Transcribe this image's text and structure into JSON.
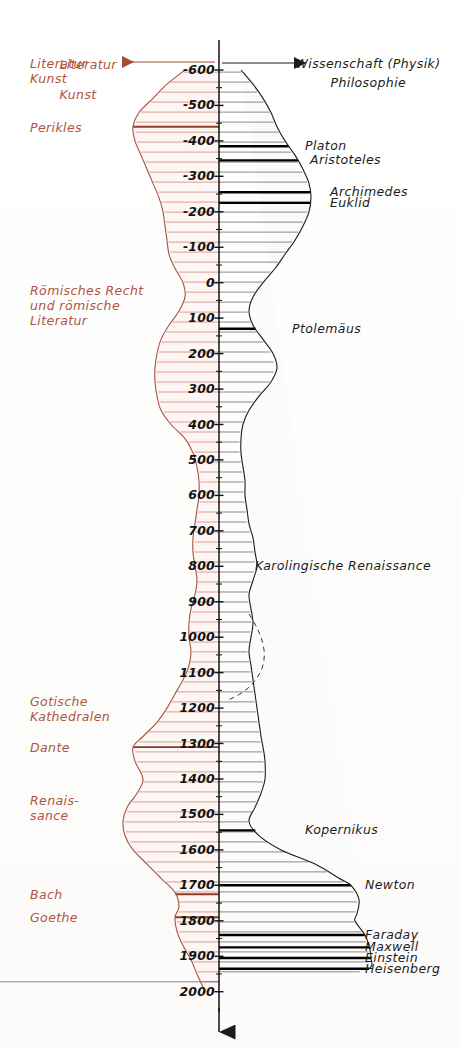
{
  "figure": {
    "title_science": "Wissenschaft (Physik)",
    "title_philosophy": "Philosophie",
    "title_literature": "Literatur",
    "title_art": "Kunst",
    "axis_bottom_marker": "arrow-down",
    "colors": {
      "left_ink": "#b0533f",
      "right_ink": "#1c1c1c",
      "axis": "#14120f",
      "paper": "#ffffff",
      "dashed": "#3a3a3a"
    }
  },
  "axis": {
    "ticks": [
      {
        "label": "-600",
        "year": -600
      },
      {
        "label": "-500",
        "year": -500
      },
      {
        "label": "-400",
        "year": -400
      },
      {
        "label": "-300",
        "year": -300
      },
      {
        "label": "-200",
        "year": -200
      },
      {
        "label": "-100",
        "year": -100
      },
      {
        "label": "0",
        "year": 0
      },
      {
        "label": "100",
        "year": 100
      },
      {
        "label": "200",
        "year": 200
      },
      {
        "label": "300",
        "year": 300
      },
      {
        "label": "400",
        "year": 400
      },
      {
        "label": "500",
        "year": 500
      },
      {
        "label": "600",
        "year": 600
      },
      {
        "label": "700",
        "year": 700
      },
      {
        "label": "800",
        "year": 800
      },
      {
        "label": "900",
        "year": 900
      },
      {
        "label": "1000",
        "year": 1000
      },
      {
        "label": "1100",
        "year": 1100
      },
      {
        "label": "1200",
        "year": 1200
      },
      {
        "label": "1300",
        "year": 1300
      },
      {
        "label": "1400",
        "year": 1400
      },
      {
        "label": "1500",
        "year": 1500
      },
      {
        "label": "1600",
        "year": 1600
      },
      {
        "label": "1700",
        "year": 1700
      },
      {
        "label": "1800",
        "year": 1800
      },
      {
        "label": "1900",
        "year": 1900
      },
      {
        "label": "2000",
        "year": 2000
      }
    ]
  },
  "labels_left": [
    {
      "id": "literatur-kunst",
      "text": "Literatur\nKunst",
      "year": -600
    },
    {
      "id": "perikles",
      "text": "Perikles",
      "year": -440
    },
    {
      "id": "roemisches-recht",
      "text": "Römisches Recht\nund römische\nLiteratur",
      "year": 60
    },
    {
      "id": "gotische-kathedralen",
      "text": "Gotische\nKathedralen",
      "year": 1200
    },
    {
      "id": "dante",
      "text": "Dante",
      "year": 1310
    },
    {
      "id": "renaissance",
      "text": "Renais-\nsance",
      "year": 1480
    },
    {
      "id": "bach",
      "text": "Bach",
      "year": 1725
    },
    {
      "id": "goethe",
      "text": "Goethe",
      "year": 1790
    }
  ],
  "labels_right": [
    {
      "id": "platon",
      "text": "Platon",
      "year": -385
    },
    {
      "id": "aristoteles",
      "text": "Aristoteles",
      "year": -345
    },
    {
      "id": "archimedes",
      "text": "Archimedes",
      "year": -255
    },
    {
      "id": "euklid",
      "text": "Euklid",
      "year": -225
    },
    {
      "id": "ptolemaeus",
      "text": "Ptolemäus",
      "year": 130
    },
    {
      "id": "karolingische-renaissance",
      "text": "Karolingische Renaissance",
      "year": 800
    },
    {
      "id": "kopernikus",
      "text": "Kopernikus",
      "year": 1545
    },
    {
      "id": "newton",
      "text": "Newton",
      "year": 1700
    },
    {
      "id": "faraday",
      "text": "Faraday",
      "year": 1840
    },
    {
      "id": "maxwell",
      "text": "Maxwell",
      "year": 1875
    },
    {
      "id": "einstein",
      "text": "Einstein",
      "year": 1905
    },
    {
      "id": "heisenberg",
      "text": "Heisenberg",
      "year": 1935
    }
  ],
  "chart_data": {
    "type": "area",
    "xlabel": "",
    "ylabel": "Jahr",
    "ylim": [
      -640,
      2010
    ],
    "grid": false,
    "legend_position": "top",
    "orientation": "vertical-time-axis-downward",
    "axis_x_px": 219,
    "note": "Paired horizontal-hatch envelope widths (arbitrary units) per side of the central time axis.",
    "series": [
      {
        "name": "Literatur / Kunst",
        "side": "left",
        "color": "#b0533f",
        "years": [
          -600,
          -560,
          -520,
          -480,
          -440,
          -400,
          -360,
          -320,
          -280,
          -240,
          -200,
          -160,
          -120,
          -80,
          -40,
          0,
          40,
          80,
          120,
          160,
          200,
          240,
          280,
          320,
          360,
          400,
          440,
          480,
          520,
          560,
          600,
          640,
          680,
          720,
          760,
          800,
          840,
          880,
          920,
          960,
          1000,
          1040,
          1080,
          1120,
          1160,
          1200,
          1240,
          1280,
          1310,
          1350,
          1400,
          1440,
          1480,
          1520,
          1560,
          1600,
          1640,
          1680,
          1720,
          1760,
          1790,
          1830,
          1870,
          1910,
          1950,
          2000
        ],
        "widths": [
          34,
          52,
          66,
          80,
          86,
          84,
          78,
          72,
          66,
          60,
          56,
          54,
          52,
          50,
          44,
          36,
          34,
          40,
          50,
          58,
          62,
          64,
          64,
          62,
          58,
          48,
          34,
          26,
          22,
          20,
          20,
          22,
          24,
          26,
          26,
          24,
          22,
          24,
          28,
          30,
          30,
          28,
          30,
          36,
          44,
          52,
          62,
          76,
          86,
          84,
          76,
          82,
          92,
          96,
          94,
          86,
          72,
          58,
          44,
          40,
          44,
          42,
          36,
          28,
          22,
          14
        ]
      },
      {
        "name": "Wissenschaft (Physik) / Philosophie",
        "side": "right",
        "color": "#1c1c1c",
        "years": [
          -600,
          -560,
          -520,
          -480,
          -440,
          -400,
          -360,
          -320,
          -280,
          -240,
          -200,
          -160,
          -120,
          -80,
          -40,
          0,
          40,
          80,
          120,
          160,
          200,
          240,
          280,
          320,
          360,
          400,
          440,
          480,
          520,
          560,
          600,
          640,
          680,
          720,
          760,
          800,
          840,
          880,
          920,
          960,
          1000,
          1040,
          1080,
          1120,
          1160,
          1200,
          1240,
          1280,
          1310,
          1350,
          1400,
          1440,
          1480,
          1520,
          1560,
          1600,
          1640,
          1680,
          1700,
          1740,
          1780,
          1800,
          1840,
          1870,
          1905,
          1935,
          1970,
          2000
        ],
        "widths": [
          22,
          34,
          44,
          52,
          58,
          66,
          76,
          84,
          90,
          92,
          90,
          84,
          76,
          66,
          56,
          44,
          34,
          30,
          34,
          44,
          54,
          58,
          52,
          40,
          30,
          24,
          22,
          22,
          24,
          26,
          26,
          28,
          30,
          34,
          36,
          38,
          34,
          30,
          32,
          34,
          32,
          30,
          32,
          34,
          36,
          38,
          40,
          42,
          44,
          46,
          46,
          42,
          36,
          30,
          40,
          62,
          96,
          120,
          132,
          140,
          138,
          136,
          146,
          150,
          152,
          150,
          120
        ]
      }
    ],
    "emphasis_lines_left": [
      {
        "year": -440,
        "label": "Perikles"
      },
      {
        "year": 1310,
        "label": "Dante"
      },
      {
        "year": 1725,
        "label": "Bach"
      },
      {
        "year": 1790,
        "label": "Goethe"
      }
    ],
    "emphasis_lines_right": [
      {
        "year": -385,
        "label": "Platon"
      },
      {
        "year": -345,
        "label": "Aristoteles"
      },
      {
        "year": -255,
        "label": "Archimedes"
      },
      {
        "year": -225,
        "label": "Euklid"
      },
      {
        "year": 130,
        "label": "Ptolemäus"
      },
      {
        "year": 1545,
        "label": "Kopernikus"
      },
      {
        "year": 1700,
        "label": "Newton"
      },
      {
        "year": 1840,
        "label": "Faraday"
      },
      {
        "year": 1875,
        "label": "Maxwell"
      },
      {
        "year": 1905,
        "label": "Einstein"
      },
      {
        "year": 1935,
        "label": "Heisenberg"
      }
    ]
  }
}
